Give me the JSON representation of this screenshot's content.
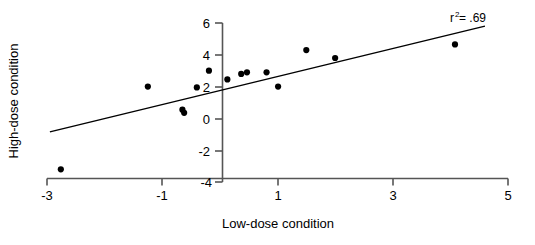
{
  "chart_data": {
    "type": "scatter",
    "title": "",
    "xlabel": "Low-dose condition",
    "ylabel": "High-dose condition",
    "xlim": [
      -3,
      5
    ],
    "ylim": [
      -4,
      6
    ],
    "xticks": [
      -3,
      -1,
      1,
      3,
      5
    ],
    "yticks": [
      -4,
      -2,
      0,
      2,
      4,
      6
    ],
    "xtick_labels": [
      "-3",
      "-1",
      "1",
      "3",
      "5"
    ],
    "ytick_labels": [
      "-4",
      "-2",
      "0",
      "2",
      "4",
      "6"
    ],
    "grid": false,
    "legend": false,
    "marker": "filled-circle",
    "marker_color": "#000000",
    "points": [
      {
        "x": -2.76,
        "y": -3.2
      },
      {
        "x": -1.25,
        "y": 2.0
      },
      {
        "x": -0.65,
        "y": 0.55
      },
      {
        "x": -0.62,
        "y": 0.35
      },
      {
        "x": -0.4,
        "y": 1.95
      },
      {
        "x": -0.19,
        "y": 3.0
      },
      {
        "x": 0.13,
        "y": 2.45
      },
      {
        "x": 0.37,
        "y": 2.8
      },
      {
        "x": 0.47,
        "y": 2.9
      },
      {
        "x": 0.81,
        "y": 2.9
      },
      {
        "x": 1.01,
        "y": 2.0
      },
      {
        "x": 1.5,
        "y": 4.3
      },
      {
        "x": 2.0,
        "y": 3.8
      },
      {
        "x": 4.08,
        "y": 4.65
      }
    ],
    "trendline": {
      "x_start": -2.95,
      "y_start": -0.85,
      "x_end": 4.6,
      "y_end": 5.8
    },
    "annotations": [
      {
        "text": "r",
        "superscript": "2",
        "suffix": " = .69",
        "x": 4.05,
        "y": 5.85
      }
    ]
  },
  "axes": {
    "x_axis_label": "Low-dose condition",
    "y_axis_label": "High-dose condition"
  },
  "annotation": {
    "r_symbol": "r",
    "r_exponent": "2",
    "r_value": " = .69"
  },
  "colors": {
    "axis": "#4d4d4d",
    "marker": "#000000",
    "trendline": "#000000",
    "text": "#000000",
    "background": "#ffffff"
  }
}
